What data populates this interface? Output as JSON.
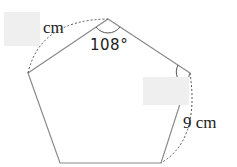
{
  "diagram": {
    "shape": "regular pentagon",
    "vertices": [
      [
        108,
        19
      ],
      [
        190,
        73
      ],
      [
        161,
        163
      ],
      [
        60,
        163
      ],
      [
        28,
        73
      ]
    ],
    "stroke_color": "#8a8a8a",
    "dashed_color": "#555555",
    "blank_box_color": "#efefef"
  },
  "labels": {
    "top_left_side_unit": "cm",
    "top_angle": "108°",
    "right_side_length": "9 cm"
  },
  "answer_blanks": [
    {
      "name": "side-length-blank",
      "x": 4,
      "y": 12,
      "w": 36,
      "h": 34
    },
    {
      "name": "angle-blank",
      "x": 143,
      "y": 77,
      "w": 46,
      "h": 28
    }
  ]
}
